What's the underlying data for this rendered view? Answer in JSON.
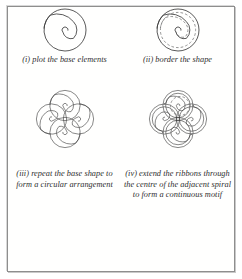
{
  "page": {
    "background_color": "#ffffff",
    "frame_color": "#8e8e8e",
    "ink_color": "#3c3c3c",
    "guide_color": "#767676"
  },
  "panels": [
    {
      "id": "step-1",
      "label": "(i)",
      "caption": "(i) plot the base elements",
      "figure_name": "single-spiral-figure",
      "figure": {
        "type": "spiral",
        "count": 1,
        "turns": 1.75,
        "direction": "counterclockwise-inward",
        "dashed_border": false
      }
    },
    {
      "id": "step-2",
      "label": "(ii)",
      "caption": "(ii) border the shape",
      "figure_name": "bordered-spiral-figure",
      "figure": {
        "type": "spiral",
        "count": 1,
        "turns": 1.75,
        "direction": "counterclockwise-inward",
        "dashed_border": true
      }
    },
    {
      "id": "step-3",
      "label": "(iii)",
      "caption": "(iii) repeat the base shape to form a circular arrangement",
      "figure_name": "four-spiral-rosette-figure",
      "figure": {
        "type": "spiral-rosette",
        "count": 4,
        "rotation_step_degrees": 90,
        "turns": 1.75,
        "direction": "counterclockwise-inward",
        "dashed_border": false
      }
    },
    {
      "id": "step-4",
      "label": "(iv)",
      "caption": "(iv) extend the ribbons through the centre of the adjacent spiral to form a continuous motif",
      "figure_name": "continuous-motif-figure",
      "figure": {
        "type": "spiral-rosette-extended",
        "count": 4,
        "rotation_step_degrees": 90,
        "turns": 2.6,
        "direction": "counterclockwise-inward",
        "dashed_border": true
      }
    }
  ]
}
